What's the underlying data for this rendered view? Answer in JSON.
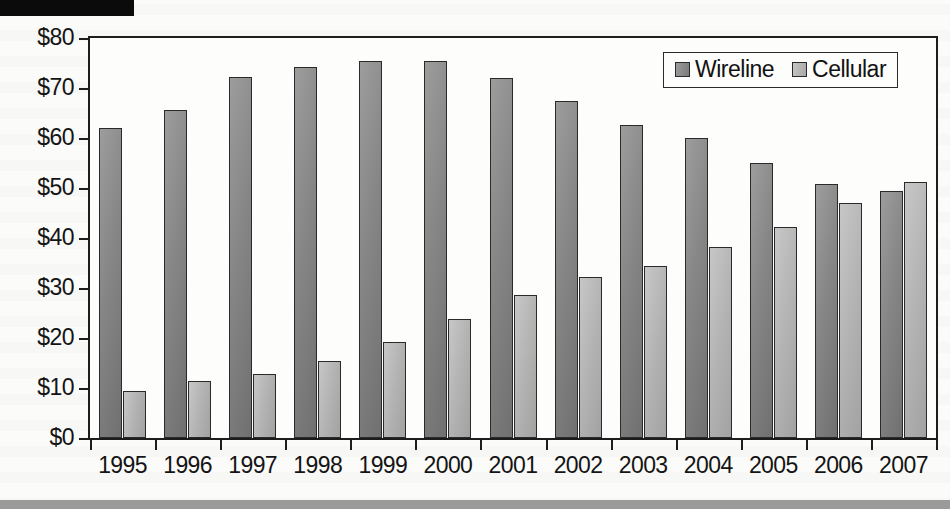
{
  "page": {
    "redaction_bar": "",
    "background_note": ""
  },
  "chart_data": {
    "type": "bar",
    "title": "",
    "xlabel": "",
    "ylabel": "",
    "ylim": [
      0,
      80
    ],
    "ytick_values": [
      0,
      10,
      20,
      30,
      40,
      50,
      60,
      70,
      80
    ],
    "ytick_labels": [
      "$0",
      "$10",
      "$20",
      "$30",
      "$40",
      "$50",
      "$60",
      "$70",
      "$80"
    ],
    "grid": false,
    "legend_position": "top-right",
    "categories": [
      "1995",
      "1996",
      "1997",
      "1998",
      "1999",
      "2000",
      "2001",
      "2002",
      "2003",
      "2004",
      "2005",
      "2006",
      "2007"
    ],
    "series": [
      {
        "name": "Wireline",
        "color": "#878787",
        "values": [
          62.1,
          65.7,
          72.2,
          74.3,
          75.5,
          75.4,
          72.0,
          67.4,
          62.6,
          60.1,
          55.0,
          50.9,
          49.5
        ]
      },
      {
        "name": "Cellular",
        "color": "#b6b6b6",
        "values": [
          9.4,
          11.4,
          12.8,
          15.4,
          19.2,
          23.9,
          28.7,
          32.3,
          34.5,
          38.2,
          42.3,
          47.0,
          51.3
        ]
      }
    ],
    "legend": [
      "Wireline",
      "Cellular"
    ]
  }
}
